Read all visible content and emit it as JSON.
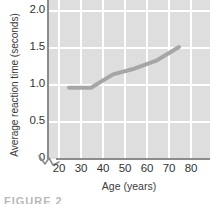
{
  "chart_data": {
    "type": "line",
    "title": "",
    "xlabel": "Age (years)",
    "ylabel": "Average reaction time (seconds)",
    "xlim": [
      15,
      85
    ],
    "ylim": [
      0,
      2.0
    ],
    "xticks": [
      20,
      30,
      40,
      50,
      60,
      70,
      80
    ],
    "xtick_labels": [
      "20",
      "30",
      "40",
      "50",
      "60",
      "70",
      "80"
    ],
    "yticks": [
      0,
      0.5,
      1.0,
      1.5,
      2.0
    ],
    "ytick_labels": [
      "0",
      "0.5",
      "1.0",
      "1.5",
      "2.0"
    ],
    "grid": true,
    "grid_color": "#ffffff",
    "plot_background": "#dedede",
    "axis_break_y": true,
    "legend": null,
    "series": [
      {
        "name": "Average reaction time",
        "color": "#a6a6a6",
        "line_width": 4,
        "x": [
          25,
          35,
          45,
          55,
          65,
          75
        ],
        "y": [
          0.95,
          0.95,
          1.13,
          1.21,
          1.32,
          1.5
        ]
      }
    ]
  },
  "caption": {
    "fragment": "FIGURE 2"
  }
}
